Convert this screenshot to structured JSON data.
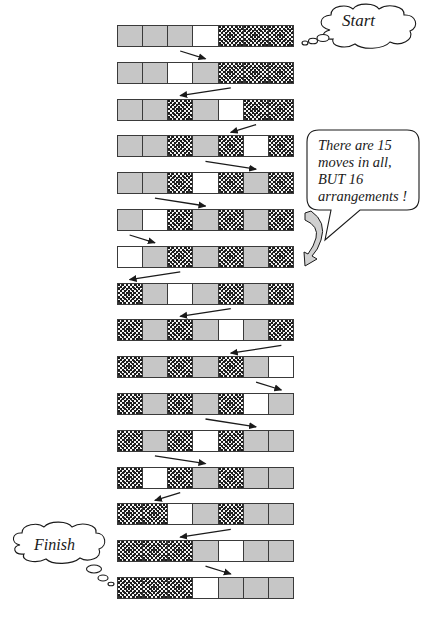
{
  "legend": {
    "G": "gray-piece",
    "D": "dotted-piece",
    "W": "empty-slot"
  },
  "colors": {
    "gray": "#c6c6c6",
    "empty": "#ffffff",
    "border": "#3a3a3a",
    "dots": "#1a1a1a"
  },
  "labels": {
    "start": "Start",
    "finish": "Finish",
    "callout": "There are 15 moves in all, BUT 16 arrangements !"
  },
  "arrangements": [
    [
      "G",
      "G",
      "G",
      "W",
      "D",
      "D",
      "D"
    ],
    [
      "G",
      "G",
      "W",
      "G",
      "D",
      "D",
      "D"
    ],
    [
      "G",
      "G",
      "D",
      "G",
      "W",
      "D",
      "D"
    ],
    [
      "G",
      "G",
      "D",
      "G",
      "D",
      "W",
      "D"
    ],
    [
      "G",
      "G",
      "D",
      "W",
      "D",
      "G",
      "D"
    ],
    [
      "G",
      "W",
      "D",
      "G",
      "D",
      "G",
      "D"
    ],
    [
      "W",
      "G",
      "D",
      "G",
      "D",
      "G",
      "D"
    ],
    [
      "D",
      "G",
      "W",
      "G",
      "D",
      "G",
      "D"
    ],
    [
      "D",
      "G",
      "D",
      "G",
      "W",
      "G",
      "D"
    ],
    [
      "D",
      "G",
      "D",
      "G",
      "D",
      "G",
      "W"
    ],
    [
      "D",
      "G",
      "D",
      "G",
      "D",
      "W",
      "G"
    ],
    [
      "D",
      "G",
      "D",
      "W",
      "D",
      "G",
      "G"
    ],
    [
      "D",
      "W",
      "D",
      "G",
      "D",
      "G",
      "G"
    ],
    [
      "D",
      "D",
      "W",
      "G",
      "D",
      "G",
      "G"
    ],
    [
      "D",
      "D",
      "D",
      "G",
      "W",
      "G",
      "G"
    ],
    [
      "D",
      "D",
      "D",
      "W",
      "G",
      "G",
      "G"
    ]
  ],
  "summary": {
    "moves": 15,
    "arrangements": 16
  }
}
